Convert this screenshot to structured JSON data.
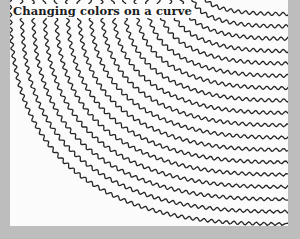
{
  "figure": {
    "title": "Changing colors on a curve",
    "colors": {
      "frame": "#bdbdbd",
      "page": "#fbfbfb",
      "ink": "#262626"
    }
  },
  "chart_data": {
    "type": "line",
    "title": "Changing colors on a curve",
    "curve_count": 18,
    "arc_center": [
      282,
      -8
    ],
    "radius_x_range": [
      88,
      282
    ],
    "radius_y_range": [
      22,
      232
    ],
    "wave_amplitude": 1.6,
    "wave_period": 7.5,
    "stroke_width": 1.3
  }
}
